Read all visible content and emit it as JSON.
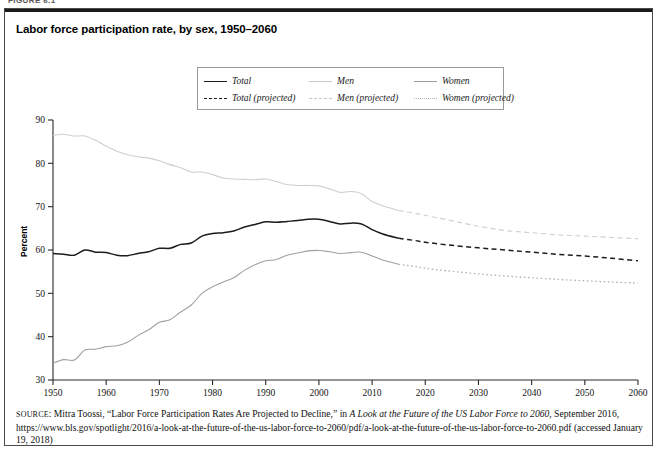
{
  "figure": {
    "label": "FIGURE 6.1"
  },
  "chart_title": "Labor force participation rate, by sex, 1950–2060",
  "legend": {
    "items": [
      {
        "label": "Total",
        "style": "solid",
        "color": "#1c1c1c"
      },
      {
        "label": "Men",
        "style": "solid",
        "color": "#cfcfcf"
      },
      {
        "label": "Women",
        "style": "solid",
        "color": "#a0a0a0"
      },
      {
        "label": "Total (projected)",
        "style": "dashed",
        "color": "#1c1c1c"
      },
      {
        "label": "Men (projected)",
        "style": "dashed",
        "color": "#cfcfcf"
      },
      {
        "label": "Women (projected)",
        "style": "dotted",
        "color": "#b2b2b2"
      }
    ]
  },
  "axes": {
    "ylabel": "Percent",
    "yticks": [
      "90",
      "80",
      "70",
      "60",
      "50",
      "40",
      "30"
    ],
    "xticks": [
      "1950",
      "1960",
      "1970",
      "1980",
      "1990",
      "2000",
      "2010",
      "2020",
      "2030",
      "2040",
      "2050",
      "2060"
    ]
  },
  "source": {
    "prefix": "SOURCE",
    "text_1": ": Mitra Toossi, “Labor Force Participation Rates Are Projected to Decline,” in ",
    "italic_1": "A Look at the Future of the US Labor Force to 2060",
    "text_2": ", September 2016, https://www.bls.gov/spotlight/2016/a-look-at-the-future-of-the-us-labor-force-to-2060/pdf/a-look-at-the-future-of-the-us-labor-force-to-2060.pdf (accessed January 19, 2018)"
  },
  "chart_data": {
    "type": "line",
    "title": "Labor force participation rate, by sex, 1950–2060",
    "xlabel": "",
    "ylabel": "Percent",
    "xlim": [
      1950,
      2060
    ],
    "ylim": [
      30,
      90
    ],
    "grid": false,
    "legend_position": "top-center",
    "projection_starts": 2015,
    "series": [
      {
        "name": "Total",
        "style": "solid",
        "color": "#1c1c1c",
        "x": [
          1950,
          1952,
          1954,
          1956,
          1958,
          1960,
          1962,
          1964,
          1966,
          1968,
          1970,
          1972,
          1974,
          1976,
          1978,
          1980,
          1982,
          1984,
          1986,
          1988,
          1990,
          1992,
          1994,
          1996,
          1998,
          2000,
          2002,
          2004,
          2006,
          2008,
          2010,
          2012,
          2015
        ],
        "y": [
          59.2,
          59.0,
          58.8,
          60.0,
          59.5,
          59.4,
          58.8,
          58.7,
          59.2,
          59.6,
          60.4,
          60.4,
          61.3,
          61.6,
          63.2,
          63.8,
          64.0,
          64.4,
          65.3,
          65.9,
          66.5,
          66.4,
          66.6,
          66.8,
          67.1,
          67.1,
          66.6,
          66.0,
          66.2,
          66.0,
          64.7,
          63.7,
          62.7
        ]
      },
      {
        "name": "Total (projected)",
        "style": "dashed",
        "color": "#1c1c1c",
        "x": [
          2015,
          2018,
          2020,
          2024,
          2030,
          2035,
          2040,
          2045,
          2050,
          2055,
          2060
        ],
        "y": [
          62.7,
          62.2,
          61.8,
          61.2,
          60.5,
          60.0,
          59.5,
          59.0,
          58.6,
          58.1,
          57.5
        ]
      },
      {
        "name": "Men",
        "style": "solid",
        "color": "#cfcfcf",
        "x": [
          1950,
          1952,
          1954,
          1956,
          1958,
          1960,
          1962,
          1964,
          1966,
          1968,
          1970,
          1972,
          1974,
          1976,
          1978,
          1980,
          1982,
          1984,
          1986,
          1988,
          1990,
          1992,
          1994,
          1996,
          1998,
          2000,
          2002,
          2004,
          2006,
          2008,
          2010,
          2012,
          2015
        ],
        "y": [
          86.4,
          86.7,
          86.3,
          86.3,
          85.3,
          84.0,
          82.8,
          82.0,
          81.5,
          81.2,
          80.6,
          79.7,
          79.0,
          78.0,
          78.0,
          77.4,
          76.6,
          76.4,
          76.3,
          76.2,
          76.4,
          75.8,
          75.1,
          74.9,
          74.9,
          74.8,
          74.1,
          73.3,
          73.5,
          73.0,
          71.2,
          70.2,
          69.1
        ]
      },
      {
        "name": "Men (projected)",
        "style": "dashed",
        "color": "#cfcfcf",
        "x": [
          2015,
          2018,
          2020,
          2024,
          2030,
          2035,
          2040,
          2045,
          2050,
          2055,
          2060
        ],
        "y": [
          69.1,
          68.5,
          68.0,
          67.0,
          65.5,
          64.5,
          64.0,
          63.5,
          63.2,
          62.9,
          62.6
        ]
      },
      {
        "name": "Women",
        "style": "solid",
        "color": "#a0a0a0",
        "x": [
          1950,
          1952,
          1954,
          1956,
          1958,
          1960,
          1962,
          1964,
          1966,
          1968,
          1970,
          1972,
          1974,
          1976,
          1978,
          1980,
          1982,
          1984,
          1986,
          1988,
          1990,
          1992,
          1994,
          1996,
          1998,
          2000,
          2002,
          2004,
          2006,
          2008,
          2010,
          2012,
          2015
        ],
        "y": [
          33.9,
          34.7,
          34.6,
          36.9,
          37.1,
          37.7,
          37.9,
          38.7,
          40.3,
          41.6,
          43.3,
          43.9,
          45.7,
          47.3,
          50.0,
          51.5,
          52.6,
          53.6,
          55.3,
          56.6,
          57.5,
          57.8,
          58.8,
          59.3,
          59.8,
          59.9,
          59.6,
          59.2,
          59.4,
          59.5,
          58.6,
          57.7,
          56.7
        ]
      },
      {
        "name": "Women (projected)",
        "style": "dotted",
        "color": "#b2b2b2",
        "x": [
          2015,
          2018,
          2020,
          2024,
          2030,
          2035,
          2040,
          2045,
          2050,
          2055,
          2060
        ],
        "y": [
          56.7,
          56.2,
          55.8,
          55.2,
          54.5,
          54.0,
          53.6,
          53.2,
          52.9,
          52.6,
          52.4
        ]
      }
    ]
  }
}
